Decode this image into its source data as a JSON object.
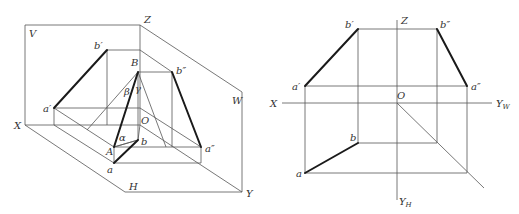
{
  "left_diagram": {
    "description": "Three-plane axonometric projection showing line AB and its projections",
    "planes": {
      "V": "V",
      "H": "H",
      "W": "W"
    },
    "axes": {
      "X": "X",
      "Y": "Y",
      "Z": "Z",
      "O": "O"
    },
    "points": {
      "A": "A",
      "B": "B",
      "a": "a",
      "b": "b",
      "a_prime": "a′",
      "b_prime": "b′",
      "a_dprime": "a″",
      "b_dprime": "b″"
    },
    "angles": {
      "alpha": "α",
      "beta": "β",
      "gamma": "γ"
    }
  },
  "right_diagram": {
    "description": "Orthographic three-view projection of line AB",
    "axes": {
      "X": "X",
      "Z": "Z",
      "O": "O",
      "YW": "Y",
      "YW_sub": "W",
      "YH": "Y",
      "YH_sub": "H"
    },
    "points": {
      "a": "a",
      "b": "b",
      "a_prime": "a′",
      "b_prime": "b′",
      "a_dprime": "a″",
      "b_dprime": "b″"
    }
  },
  "colors": {
    "line": "#555555",
    "projection_line": "#1a1a1a",
    "label": "#333333"
  }
}
